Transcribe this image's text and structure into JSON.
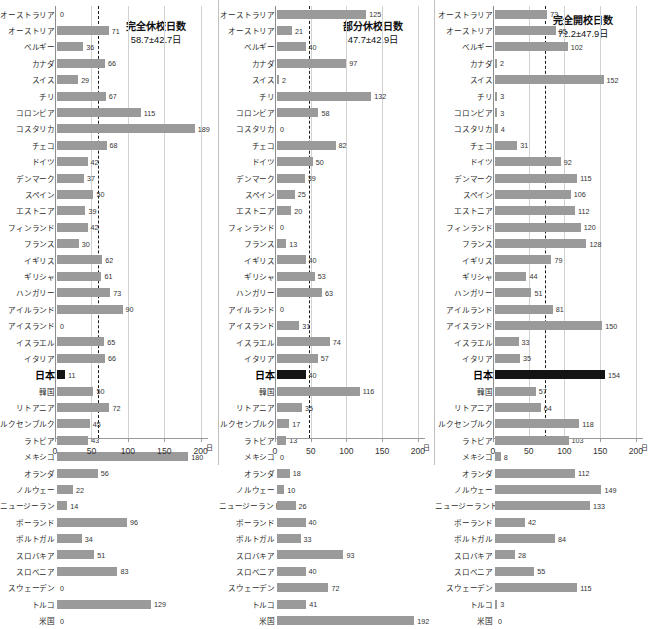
{
  "figure": {
    "unit_label": "日",
    "x_ticks": [
      "0",
      "50",
      "100",
      "150",
      "200"
    ],
    "countries": [
      "オーストラリア",
      "オーストリア",
      "ベルギー",
      "カナダ",
      "スイス",
      "チリ",
      "コロンビア",
      "コスタリカ",
      "チェコ",
      "ドイツ",
      "デンマーク",
      "スペイン",
      "エストニア",
      "フィンランド",
      "フランス",
      "イギリス",
      "ギリシャ",
      "ハンガリー",
      "アイルランド",
      "アイスランド",
      "イスラエル",
      "イタリア",
      "日本",
      "韓国",
      "リトアニア",
      "ルクセンブルク",
      "ラトビア",
      "メキシコ",
      "オランダ",
      "ノルウェー",
      "ニュージーランド",
      "ポーランド",
      "ポルトガル",
      "スロバキア",
      "スロベニア",
      "スウェーデン",
      "トルコ",
      "米国"
    ],
    "highlight_country": "日本"
  },
  "chart_data": [
    {
      "type": "bar",
      "title": "完全休校日数",
      "subtitle": "58.7±42.7日",
      "mean": 58.7,
      "sd": 42.7,
      "xlabel": "日",
      "ylabel": "",
      "xlim": [
        0,
        210
      ],
      "grid": true,
      "orientation": "horizontal",
      "categories": [
        "オーストラリア",
        "オーストリア",
        "ベルギー",
        "カナダ",
        "スイス",
        "チリ",
        "コロンビア",
        "コスタリカ",
        "チェコ",
        "ドイツ",
        "デンマーク",
        "スペイン",
        "エストニア",
        "フィンランド",
        "フランス",
        "イギリス",
        "ギリシャ",
        "ハンガリー",
        "アイルランド",
        "アイスランド",
        "イスラエル",
        "イタリア",
        "日本",
        "韓国",
        "リトアニア",
        "ルクセンブルク",
        "ラトビア",
        "メキシコ",
        "オランダ",
        "ノルウェー",
        "ニュージーランド",
        "ポーランド",
        "ポルトガル",
        "スロバキア",
        "スロベニア",
        "スウェーデン",
        "トルコ",
        "米国"
      ],
      "values": [
        0,
        71,
        36,
        66,
        29,
        67,
        115,
        189,
        68,
        42,
        37,
        50,
        39,
        42,
        30,
        62,
        61,
        73,
        90,
        0,
        65,
        66,
        11,
        50,
        72,
        45,
        43,
        180,
        56,
        22,
        14,
        96,
        34,
        51,
        83,
        0,
        129,
        0
      ]
    },
    {
      "type": "bar",
      "title": "部分休校日数",
      "subtitle": "47.7±42.9日",
      "mean": 47.7,
      "sd": 42.9,
      "xlabel": "日",
      "ylabel": "",
      "xlim": [
        0,
        210
      ],
      "grid": true,
      "orientation": "horizontal",
      "categories": [
        "オーストラリア",
        "オーストリア",
        "ベルギー",
        "カナダ",
        "スイス",
        "チリ",
        "コロンビア",
        "コスタリカ",
        "チェコ",
        "ドイツ",
        "デンマーク",
        "スペイン",
        "エストニア",
        "フィンランド",
        "フランス",
        "イギリス",
        "ギリシャ",
        "ハンガリー",
        "アイルランド",
        "アイスランド",
        "イスラエル",
        "イタリア",
        "日本",
        "韓国",
        "リトアニア",
        "ルクセンブルク",
        "ラトビア",
        "メキシコ",
        "オランダ",
        "ノルウェー",
        "ニュージーランド",
        "ポーランド",
        "ポルトガル",
        "スロバキア",
        "スロベニア",
        "スウェーデン",
        "トルコ",
        "米国"
      ],
      "values": [
        125,
        21,
        40,
        97,
        2,
        132,
        58,
        0,
        82,
        50,
        39,
        25,
        20,
        0,
        13,
        40,
        53,
        63,
        0,
        31,
        74,
        57,
        40,
        116,
        35,
        17,
        13,
        0,
        18,
        10,
        26,
        40,
        33,
        93,
        40,
        72,
        41,
        192
      ]
    },
    {
      "type": "bar",
      "title": "完全開校日数",
      "subtitle": "72.2±47.9日",
      "mean": 72.2,
      "sd": 47.9,
      "xlabel": "日",
      "ylabel": "",
      "xlim": [
        0,
        210
      ],
      "grid": true,
      "orientation": "horizontal",
      "categories": [
        "オーストラリア",
        "オーストリア",
        "ベルギー",
        "カナダ",
        "スイス",
        "チリ",
        "コロンビア",
        "コスタリカ",
        "チェコ",
        "ドイツ",
        "デンマーク",
        "スペイン",
        "エストニア",
        "フィンランド",
        "フランス",
        "イギリス",
        "ギリシャ",
        "ハンガリー",
        "アイルランド",
        "アイスランド",
        "イスラエル",
        "イタリア",
        "日本",
        "韓国",
        "リトアニア",
        "ルクセンブルク",
        "ラトビア",
        "メキシコ",
        "オランダ",
        "ノルウェー",
        "ニュージーランド",
        "ポーランド",
        "ポルトガル",
        "スロバキア",
        "スロベニア",
        "スウェーデン",
        "トルコ",
        "米国"
      ],
      "values": [
        73,
        85,
        102,
        2,
        152,
        3,
        3,
        4,
        31,
        92,
        115,
        106,
        112,
        120,
        128,
        79,
        44,
        51,
        81,
        150,
        33,
        35,
        154,
        57,
        64,
        118,
        103,
        8,
        112,
        149,
        133,
        42,
        84,
        28,
        55,
        115,
        3,
        0
      ]
    }
  ]
}
